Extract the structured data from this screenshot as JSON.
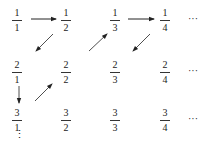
{
  "rows": [
    {
      "cells": [
        {
          "num": "1",
          "den": "1"
        },
        {
          "num": "1",
          "den": "2"
        },
        {
          "num": "1",
          "den": "3"
        },
        {
          "num": "1",
          "den": "4"
        }
      ],
      "ellipsis": "···"
    },
    {
      "cells": [
        {
          "num": "2",
          "den": "1"
        },
        {
          "num": "2",
          "den": "2"
        },
        {
          "num": "2",
          "den": "3"
        },
        {
          "num": "2",
          "den": "4"
        }
      ],
      "ellipsis": "···"
    },
    {
      "cells": [
        {
          "num": "3",
          "den": "1"
        },
        {
          "num": "3",
          "den": "2"
        },
        {
          "num": "3",
          "den": "3"
        },
        {
          "num": "3",
          "den": "4"
        }
      ],
      "ellipsis": "···"
    }
  ],
  "column_ellipsis": "⋮",
  "arrows": [
    {
      "from": "1/1",
      "to": "1/2",
      "direction": "right"
    },
    {
      "from": "1/2",
      "to": "2/1",
      "direction": "down-left"
    },
    {
      "from": "2/1",
      "to": "3/1",
      "direction": "down"
    },
    {
      "from": "3/1",
      "to": "2/2",
      "direction": "up-right"
    },
    {
      "from": "2/2",
      "to": "1/3",
      "direction": "up-right"
    },
    {
      "from": "1/3",
      "to": "1/4",
      "direction": "right"
    },
    {
      "from": "1/4",
      "to": "2/3",
      "direction": "down-left"
    }
  ]
}
